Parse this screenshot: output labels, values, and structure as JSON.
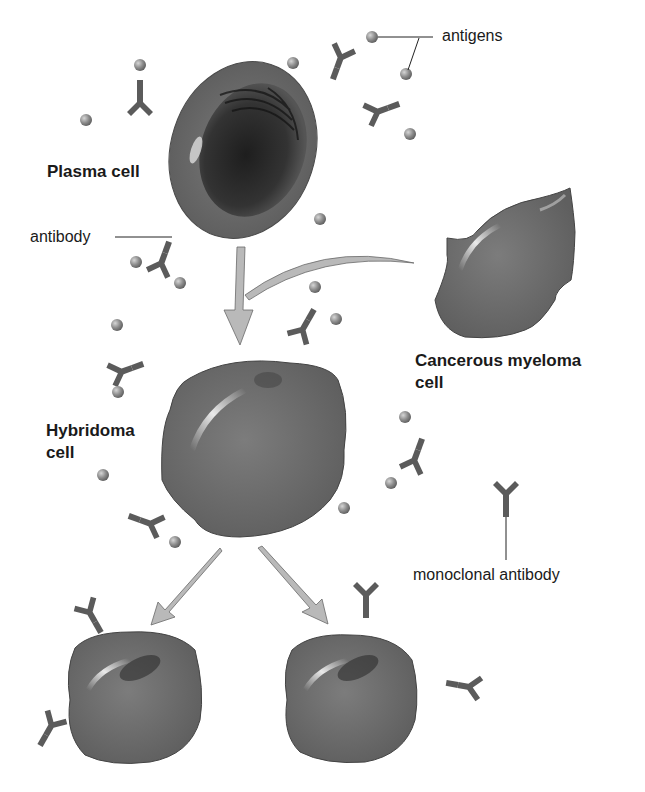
{
  "diagram": {
    "labels": {
      "antigens": "antigens",
      "plasma_cell": "Plasma cell",
      "antibody": "antibody",
      "myeloma_line1": "Cancerous myeloma",
      "myeloma_line2": "cell",
      "hybridoma_line1": "Hybridoma",
      "hybridoma_line2": "cell",
      "monoclonal": "monoclonal antibody"
    },
    "nodes": [
      {
        "id": "plasma-cell",
        "label": "Plasma cell"
      },
      {
        "id": "myeloma-cell",
        "label": "Cancerous myeloma cell"
      },
      {
        "id": "hybridoma-cell",
        "label": "Hybridoma cell"
      },
      {
        "id": "clone-left",
        "label": ""
      },
      {
        "id": "clone-right",
        "label": ""
      }
    ],
    "edges": [
      {
        "from": "plasma-cell",
        "to": "hybridoma-cell"
      },
      {
        "from": "myeloma-cell",
        "to": "hybridoma-cell"
      },
      {
        "from": "hybridoma-cell",
        "to": "clone-left"
      },
      {
        "from": "hybridoma-cell",
        "to": "clone-right"
      }
    ],
    "colors": {
      "cell": "#6e6e6e",
      "cell_dark": "#3a3a3a",
      "antibody": "#5a5a5a",
      "antigen": "#8a8a8a",
      "arrow": "#b9b9b9"
    }
  }
}
